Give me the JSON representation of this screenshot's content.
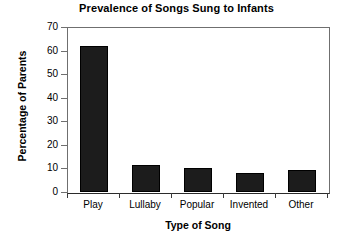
{
  "chart_data": {
    "type": "bar",
    "title": "Prevalence of Songs Sung to Infants",
    "xlabel": "Type of Song",
    "ylabel": "Percentage of Parents",
    "categories": [
      "Play",
      "Lullaby",
      "Popular",
      "Invented",
      "Other"
    ],
    "values": [
      62,
      11.5,
      10,
      8,
      9.5
    ],
    "ylim": [
      0,
      70
    ],
    "yticks": [
      0,
      10,
      20,
      30,
      40,
      50,
      60,
      70
    ],
    "ytick_labels": [
      "0",
      "10",
      "20",
      "30",
      "40",
      "50",
      "60",
      "70"
    ],
    "grid": false,
    "legend": false,
    "bar_color": "#1c1c1c",
    "axis_color": "#6f6f6f",
    "background": "#ffffff"
  }
}
